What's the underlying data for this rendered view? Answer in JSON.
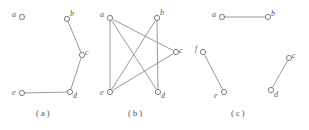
{
  "figure": {
    "stroke_color": "#8d8c92",
    "vertex_fill": "#ffffff",
    "vertex_stroke": "#6f6e75",
    "label_color": "#5a5960",
    "background": "#ffffff",
    "width": 309,
    "height": 130
  },
  "panels": [
    {
      "id": "a",
      "caption": "( a )",
      "caption_x": 36,
      "caption_y": 108,
      "vertices": [
        {
          "id": "a",
          "label": "a",
          "x": 22,
          "y": 17,
          "r": 2.6,
          "lx": 12,
          "ly": 11
        },
        {
          "id": "b",
          "label": "b",
          "x": 67,
          "y": 19,
          "r": 2.6,
          "lx": 70,
          "ly": 10
        },
        {
          "id": "c",
          "label": "c",
          "x": 82,
          "y": 55,
          "r": 2.6,
          "lx": 85,
          "ly": 49
        },
        {
          "id": "d",
          "label": "d",
          "x": 70,
          "y": 92,
          "r": 2.6,
          "lx": 73,
          "ly": 92
        },
        {
          "id": "e",
          "label": "e",
          "x": 22,
          "y": 93,
          "r": 2.6,
          "lx": 12,
          "ly": 89
        }
      ],
      "edges": [
        {
          "from": "b",
          "to": "c"
        },
        {
          "from": "c",
          "to": "d"
        },
        {
          "from": "d",
          "to": "e"
        }
      ]
    },
    {
      "id": "b",
      "caption": "( b )",
      "caption_x": 128,
      "caption_y": 108,
      "vertices": [
        {
          "id": "a",
          "label": "a",
          "x": 110,
          "y": 18,
          "r": 2.6,
          "lx": 100,
          "ly": 11
        },
        {
          "id": "b",
          "label": "b",
          "x": 157,
          "y": 18,
          "r": 2.6,
          "lx": 160,
          "ly": 9
        },
        {
          "id": "c",
          "label": "c",
          "x": 176,
          "y": 52,
          "r": 2.6,
          "lx": 179,
          "ly": 47
        },
        {
          "id": "d",
          "label": "d",
          "x": 158,
          "y": 92,
          "r": 2.6,
          "lx": 161,
          "ly": 92
        },
        {
          "id": "e",
          "label": "e",
          "x": 110,
          "y": 92,
          "r": 2.6,
          "lx": 100,
          "ly": 89
        }
      ],
      "edges": [
        {
          "from": "a",
          "to": "e"
        },
        {
          "from": "a",
          "to": "c"
        },
        {
          "from": "a",
          "to": "d"
        },
        {
          "from": "b",
          "to": "d"
        },
        {
          "from": "b",
          "to": "e"
        },
        {
          "from": "e",
          "to": "c"
        }
      ]
    },
    {
      "id": "c",
      "caption": "( c )",
      "caption_x": 231,
      "caption_y": 108,
      "vertices": [
        {
          "id": "a",
          "label": "a",
          "x": 222,
          "y": 17,
          "r": 2.6,
          "lx": 212,
          "ly": 11
        },
        {
          "id": "b",
          "label": "b",
          "x": 268,
          "y": 17,
          "r": 2.6,
          "lx": 271,
          "ly": 10
        },
        {
          "id": "c",
          "label": "c",
          "x": 289,
          "y": 58,
          "r": 2.6,
          "lx": 292,
          "ly": 52
        },
        {
          "id": "d",
          "label": "d",
          "x": 271,
          "y": 90,
          "r": 2.6,
          "lx": 274,
          "ly": 91
        },
        {
          "id": "e",
          "label": "e",
          "x": 224,
          "y": 92,
          "r": 2.6,
          "lx": 214,
          "ly": 92
        },
        {
          "id": "f",
          "label": "f",
          "x": 203,
          "y": 52,
          "r": 2.6,
          "lx": 195,
          "ly": 45
        }
      ],
      "edges": [
        {
          "from": "a",
          "to": "b"
        },
        {
          "from": "f",
          "to": "e"
        },
        {
          "from": "c",
          "to": "d"
        }
      ]
    }
  ]
}
